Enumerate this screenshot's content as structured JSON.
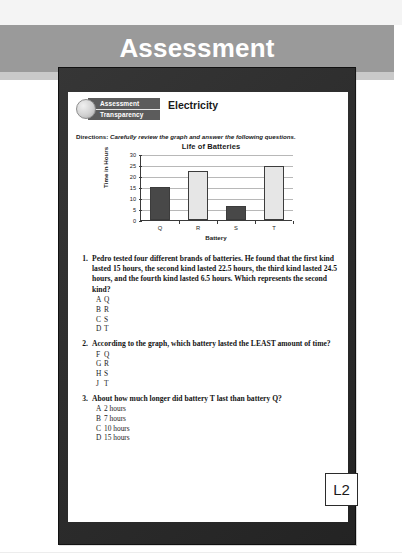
{
  "banner": {
    "title": "Assessment",
    "bg_color": "#9a9a9a",
    "text_color": "#ffffff"
  },
  "worksheet": {
    "logo": {
      "line1": "Assessment",
      "line2": "Transparency",
      "band_color": "#5c5c5c"
    },
    "topic": "Electricity",
    "directions_label": "Directions:",
    "directions_text": " Carefully review the graph and answer the following questions."
  },
  "chart_data": {
    "type": "bar",
    "title": "Life of Batteries",
    "xlabel": "Battery",
    "ylabel": "Time in Hours",
    "categories": [
      "Q",
      "R",
      "S",
      "T"
    ],
    "values": [
      15,
      22.5,
      6.5,
      24.5
    ],
    "bar_styles": [
      "dark",
      "light",
      "dark",
      "light"
    ],
    "bar_colors": {
      "dark": "#484848",
      "light": "#e6e6e6"
    },
    "ylim": [
      0,
      30
    ],
    "yticks": [
      0,
      5,
      10,
      15,
      20,
      25,
      30
    ],
    "grid": true,
    "legend": "none"
  },
  "questions": [
    {
      "number": "1.",
      "stem": "Pedro tested four different brands of batteries. He found that the first kind lasted 15 hours, the second kind lasted 22.5 hours, the third kind lasted 24.5 hours, and the fourth kind lasted 6.5 hours. Which represents the second kind?",
      "choices": [
        {
          "letter": "A",
          "text": "Q"
        },
        {
          "letter": "B",
          "text": "R"
        },
        {
          "letter": "C",
          "text": "S"
        },
        {
          "letter": "D",
          "text": "T"
        }
      ]
    },
    {
      "number": "2.",
      "stem": "According to the graph, which battery lasted the LEAST amount of time?",
      "choices": [
        {
          "letter": "F",
          "text": "Q"
        },
        {
          "letter": "G",
          "text": "R"
        },
        {
          "letter": "H",
          "text": "S"
        },
        {
          "letter": "J",
          "text": "T"
        }
      ]
    },
    {
      "number": "3.",
      "stem": "About how much longer did battery T last than battery Q?",
      "choices": [
        {
          "letter": "A",
          "text": "2 hours"
        },
        {
          "letter": "B",
          "text": "7 hours"
        },
        {
          "letter": "C",
          "text": "10 hours"
        },
        {
          "letter": "D",
          "text": "15 hours"
        }
      ]
    }
  ],
  "level_badge": "L2"
}
